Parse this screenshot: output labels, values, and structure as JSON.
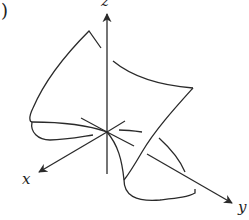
{
  "figure": {
    "label_fragment": ")",
    "axes": {
      "x_label": "x",
      "y_label": "y",
      "z_label": "z"
    },
    "stroke_color": "#2a2a2a",
    "background": "#ffffff"
  }
}
